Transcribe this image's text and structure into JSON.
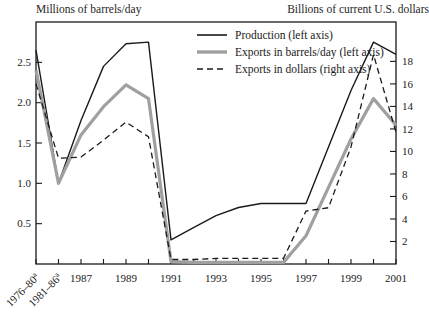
{
  "chart_data": {
    "type": "line",
    "title": "",
    "ylabel": "Millions of barrels/day",
    "ylabel_right": "Billions of current U.S. dollars",
    "xlabel": "",
    "grid": false,
    "legend_position": "top-center",
    "categories": [
      "1976–80",
      "1981–86",
      "1987",
      "1988",
      "1989",
      "1990",
      "1991",
      "1992",
      "1993",
      "1994",
      "1995",
      "1996",
      "1997",
      "1998",
      "1999",
      "2000",
      "2001"
    ],
    "xtick_labels": [
      "1976–80",
      "1981–86",
      "1987",
      "",
      "1989",
      "",
      "1991",
      "",
      "1993",
      "",
      "1995",
      "",
      "1997",
      "",
      "1999",
      "",
      "2001"
    ],
    "xtick_superscripts": [
      "a",
      "a",
      "",
      "",
      "",
      "",
      "",
      "",
      "",
      "",
      "",
      "",
      "",
      "",
      "",
      "",
      ""
    ],
    "ylim": [
      0,
      3.0
    ],
    "yticks": [
      0.5,
      1.0,
      1.5,
      2.0,
      2.5
    ],
    "ytick_labels": [
      "0.5",
      "1.0",
      "1.5",
      "2.0",
      "2.5"
    ],
    "ylim_right": [
      0,
      21.5
    ],
    "yticks_right": [
      2,
      4,
      6,
      8,
      10,
      12,
      14,
      16,
      18
    ],
    "ytick_labels_right": [
      "2",
      "4",
      "6",
      "8",
      "10",
      "12",
      "14",
      "16",
      "18"
    ],
    "series": [
      {
        "name": "Production (left axis)",
        "axis": "left",
        "style": "solid",
        "color": "#1a1a1a",
        "width": 1.4,
        "values": [
          2.65,
          1.0,
          1.78,
          2.45,
          2.73,
          2.75,
          0.3,
          0.45,
          0.6,
          0.7,
          0.75,
          0.75,
          0.75,
          1.45,
          2.15,
          2.75,
          2.6
        ]
      },
      {
        "name": "Exports in barrels/day (left axis)",
        "axis": "left",
        "style": "solid",
        "color": "#a0a0a0",
        "width": 3.2,
        "values": [
          2.4,
          1.0,
          1.6,
          1.95,
          2.22,
          2.05,
          0.03,
          0.02,
          0.02,
          0.02,
          0.02,
          0.02,
          0.35,
          0.95,
          1.55,
          2.05,
          1.72
        ]
      },
      {
        "name": "Exports in dollars (right axis)",
        "axis": "right",
        "style": "dashed",
        "color": "#1a1a1a",
        "width": 1.3,
        "values": [
          16.0,
          9.4,
          9.5,
          11.0,
          12.6,
          11.3,
          0.4,
          0.4,
          0.5,
          0.5,
          0.5,
          0.5,
          4.7,
          5.0,
          10.4,
          18.6,
          11.7
        ]
      }
    ],
    "legend": [
      {
        "label": "Production (left axis)",
        "style": "solid",
        "color": "#1a1a1a",
        "width": 1.6
      },
      {
        "label": "Exports in barrels/day (left axis)",
        "style": "solid",
        "color": "#a0a0a0",
        "width": 3.4
      },
      {
        "label": "Exports in dollars (right axis)",
        "style": "dashed",
        "color": "#1a1a1a",
        "width": 1.4
      }
    ]
  },
  "plot_geometry": {
    "left": 36,
    "right": 396,
    "top": 22,
    "bottom": 264
  }
}
